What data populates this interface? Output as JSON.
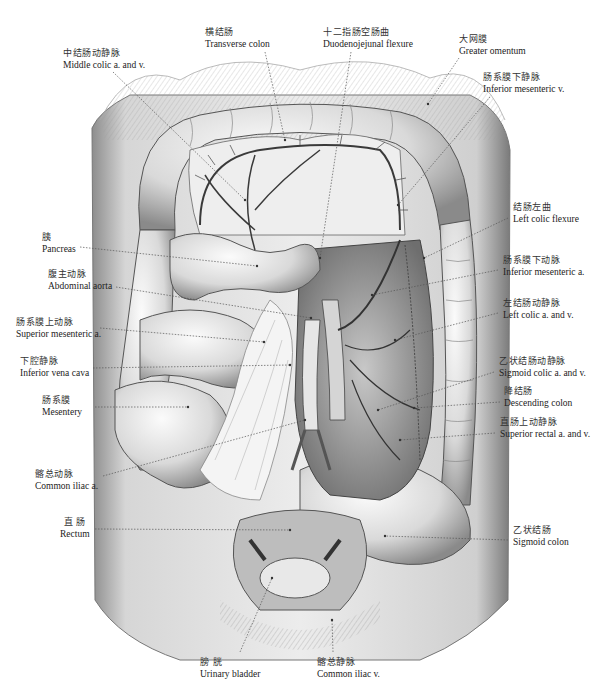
{
  "figure": {
    "type": "anatomical illustration",
    "style": "grayscale pencil drawing"
  },
  "labels": [
    {
      "id": "transverse-colon",
      "zh": "横结肠",
      "en": "Transverse colon",
      "x": 205,
      "y": 26,
      "align": "left",
      "leader": [
        [
          265,
          52
        ],
        [
          285,
          140
        ]
      ]
    },
    {
      "id": "duodenojejunal-flexure",
      "zh": "十二指肠空肠曲",
      "en": "Duodenojejunal flexure",
      "x": 323,
      "y": 26,
      "align": "left",
      "leader": [
        [
          351,
          52
        ],
        [
          320,
          258
        ]
      ]
    },
    {
      "id": "middle-colic",
      "zh": "中结肠动静脉",
      "en": "Middle colic a. and v.",
      "x": 63,
      "y": 47,
      "align": "left",
      "leader": [
        [
          113,
          72
        ],
        [
          245,
          200
        ]
      ]
    },
    {
      "id": "greater-omentum",
      "zh": "大网膜",
      "en": "Greater omentum",
      "x": 459,
      "y": 33,
      "align": "left",
      "leader": [
        [
          459,
          58
        ],
        [
          428,
          104
        ]
      ]
    },
    {
      "id": "inferior-mesenteric-v",
      "zh": "肠系膜下静脉",
      "en": "Inferior mesenteric v.",
      "x": 483,
      "y": 71,
      "align": "left",
      "leader": [
        [
          490,
          97
        ],
        [
          398,
          205
        ]
      ]
    },
    {
      "id": "left-colic-flexure",
      "zh": "结肠左曲",
      "en": "Left colic flexure",
      "x": 513,
      "y": 201,
      "align": "left",
      "leader": [
        [
          508,
          218
        ],
        [
          424,
          258
        ]
      ]
    },
    {
      "id": "pancreas",
      "zh": "胰",
      "en": "Pancreas",
      "x": 42,
      "y": 231,
      "align": "left",
      "leader": [
        [
          80,
          247
        ],
        [
          257,
          266
        ]
      ]
    },
    {
      "id": "inferior-mesenteric-a",
      "zh": "肠系膜下动脉",
      "en": "Inferior mesenteric a.",
      "x": 503,
      "y": 254,
      "align": "left",
      "leader": [
        [
          498,
          270
        ],
        [
          372,
          295
        ]
      ]
    },
    {
      "id": "abdominal-aorta",
      "zh": "腹主动脉",
      "en": "Abdominal aorta",
      "x": 48,
      "y": 268,
      "align": "left",
      "leader": [
        [
          116,
          287
        ],
        [
          311,
          318
        ]
      ]
    },
    {
      "id": "left-colic-av",
      "zh": "左结肠动静脉",
      "en": "Left colic a. and v.",
      "x": 503,
      "y": 297,
      "align": "left",
      "leader": [
        [
          498,
          313
        ],
        [
          395,
          340
        ]
      ]
    },
    {
      "id": "superior-mesenteric-a",
      "zh": "肠系膜上动脉",
      "en": "Superior mesenteric a.",
      "x": 16,
      "y": 316,
      "align": "left",
      "leader": [
        [
          100,
          328
        ],
        [
          264,
          342
        ]
      ]
    },
    {
      "id": "inferior-vena-cava",
      "zh": "下腔静脉",
      "en": "Inferior vena cava",
      "x": 20,
      "y": 355,
      "align": "left",
      "leader": [
        [
          93,
          368
        ],
        [
          290,
          365
        ]
      ]
    },
    {
      "id": "sigmoid-colic-av",
      "zh": "乙状结肠动静脉",
      "en": "Sigmoid colic a. and v.",
      "x": 499,
      "y": 355,
      "align": "left",
      "leader": [
        [
          494,
          372
        ],
        [
          378,
          410
        ]
      ]
    },
    {
      "id": "descending-colon",
      "zh": "降结肠",
      "en": "Descending colon",
      "x": 504,
      "y": 385,
      "align": "left",
      "leader": [
        [
          500,
          402
        ],
        [
          414,
          408
        ]
      ]
    },
    {
      "id": "mesentery",
      "zh": "肠系膜",
      "en": "Mesentery",
      "x": 42,
      "y": 394,
      "align": "left",
      "leader": [
        [
          95,
          407
        ],
        [
          188,
          407
        ]
      ]
    },
    {
      "id": "superior-rectal-av",
      "zh": "直肠上动静脉",
      "en": "Superior rectal a. and v.",
      "x": 500,
      "y": 416,
      "align": "left",
      "leader": [
        [
          495,
          433
        ],
        [
          400,
          440
        ]
      ]
    },
    {
      "id": "common-iliac-a",
      "zh": "髂总动脉",
      "en": "Common iliac a.",
      "x": 35,
      "y": 468,
      "align": "left",
      "leader": [
        [
          103,
          476
        ],
        [
          305,
          420
        ]
      ]
    },
    {
      "id": "rectum",
      "zh": "直 肠",
      "en": "Rectum",
      "x": 60,
      "y": 516,
      "align": "center",
      "leader": [
        [
          95,
          529
        ],
        [
          290,
          530
        ]
      ]
    },
    {
      "id": "sigmoid-colon",
      "zh": "乙状结肠",
      "en": "Sigmoid colon",
      "x": 513,
      "y": 524,
      "align": "left",
      "leader": [
        [
          508,
          540
        ],
        [
          385,
          536
        ]
      ]
    },
    {
      "id": "urinary-bladder",
      "zh": "膀 胱",
      "en": "Urinary bladder",
      "x": 200,
      "y": 656,
      "align": "left",
      "leader": [
        [
          240,
          652
        ],
        [
          272,
          578
        ]
      ]
    },
    {
      "id": "common-iliac-v",
      "zh": "髂总静脉",
      "en": "Common iliac v.",
      "x": 317,
      "y": 656,
      "align": "left",
      "leader": [
        [
          333,
          652
        ],
        [
          332,
          620
        ]
      ]
    }
  ],
  "colors": {
    "background": "#ffffff",
    "ink": "#222222",
    "leader": "#555555"
  }
}
